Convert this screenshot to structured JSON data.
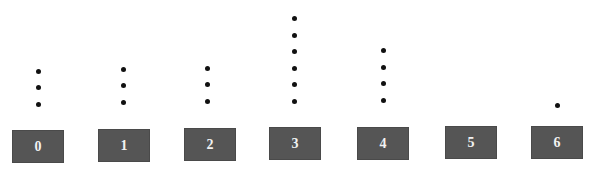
{
  "chart_data": {
    "type": "dot plot",
    "title": "",
    "xlabel": "",
    "ylabel": "",
    "categories": [
      "0",
      "1",
      "2",
      "3",
      "4",
      "5",
      "6"
    ],
    "values": [
      3,
      3,
      3,
      6,
      4,
      0,
      1
    ],
    "grid": false,
    "legend": null
  },
  "layout": {
    "box_x": [
      12,
      98,
      184,
      269,
      357,
      445,
      531
    ],
    "box_y": [
      130,
      129,
      128,
      127,
      127,
      126,
      126
    ],
    "dot_x": [
      38,
      123,
      207,
      294,
      383,
      471,
      557
    ],
    "dot_base_y": [
      104,
      102,
      101,
      101,
      100,
      105,
      105
    ],
    "dot_spacing": 16.5
  },
  "colors": {
    "box": "#555555",
    "label": "#f2f2f2",
    "dot": "#111111"
  }
}
